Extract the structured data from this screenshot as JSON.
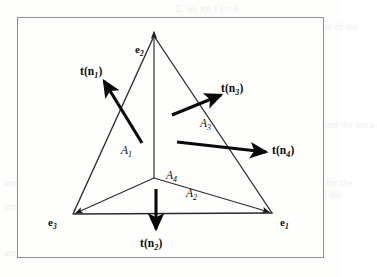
{
  "figure": {
    "kind": "tetrahedron-traction-diagram",
    "frame": {
      "border_color": "#8e8e92",
      "background_color": "#fefefd"
    },
    "ink_color": "#0a0a0a",
    "thin_line_color": "#2b2b2b"
  },
  "basis_vectors": [
    {
      "id": "e1",
      "base": "e",
      "sub": "1",
      "x": 280,
      "y": 217
    },
    {
      "id": "e2",
      "base": "e",
      "sub": "2",
      "x": 135,
      "y": 44
    },
    {
      "id": "e3",
      "base": "e",
      "sub": "3",
      "x": 48,
      "y": 217
    }
  ],
  "tractions": [
    {
      "id": "tn1",
      "base": "t(n",
      "sub": "1",
      "tail": ")",
      "x": 80,
      "y": 66
    },
    {
      "id": "tn2",
      "base": "t(n",
      "sub": "2",
      "tail": ")",
      "x": 140,
      "y": 238
    },
    {
      "id": "tn3",
      "base": "t(n",
      "sub": "3",
      "tail": ")",
      "x": 221,
      "y": 83
    },
    {
      "id": "tn4",
      "base": "t(n",
      "sub": "4",
      "tail": ")",
      "x": 272,
      "y": 145
    }
  ],
  "areas": [
    {
      "id": "A1",
      "base": "A",
      "sub": "1",
      "x": 121,
      "y": 145
    },
    {
      "id": "A2",
      "base": "A",
      "sub": "2",
      "x": 186,
      "y": 188
    },
    {
      "id": "A3",
      "base": "A",
      "sub": "3",
      "x": 200,
      "y": 118
    },
    {
      "id": "A4",
      "base": "A",
      "sub": "4",
      "x": 166,
      "y": 170
    }
  ],
  "background_bleed": [
    {
      "x": 176,
      "y": 2,
      "text": "Σ  w( t(n ) ) = 0"
    },
    {
      "x": 176,
      "y": 20,
      "text": "from which it follows that the resultant of the"
    },
    {
      "x": 176,
      "y": 30,
      "text": "surface tractions vanishes"
    },
    {
      "x": 176,
      "y": 52,
      "text": "t(n ) A  + T(n ) A  + t(n ) A  = 0"
    },
    {
      "x": 176,
      "y": 80,
      "text": "... A  t(n ) + A  T(n ) + A  t(n ) ..."
    },
    {
      "x": 176,
      "y": 98,
      "text": "and hence"
    },
    {
      "x": 176,
      "y": 118,
      "text": "Thus the stress vector on any plane from the tetra-"
    },
    {
      "x": 176,
      "y": 140,
      "text": "( 1 )"
    },
    {
      "x": 176,
      "y": 176,
      "text": "Thus the stress vector t(n) on a plane for the"
    },
    {
      "x": 176,
      "y": 188,
      "text": "normal n is given by  t(n) = n · T  and the"
    },
    {
      "x": 176,
      "y": 200,
      "text": "components of the stress tensor"
    },
    {
      "x": 176,
      "y": 216,
      "text": "are the tractions"
    },
    {
      "x": 176,
      "y": 240,
      "text": "of the surface."
    },
    {
      "x": 4,
      "y": 176,
      "text": "and its"
    },
    {
      "x": 4,
      "y": 200,
      "text": "stress"
    },
    {
      "x": 4,
      "y": 246,
      "text": "are"
    }
  ]
}
